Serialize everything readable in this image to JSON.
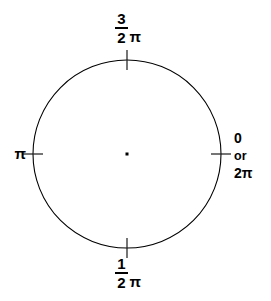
{
  "figure": {
    "type": "unit-circle-radian-diagram",
    "title": "",
    "canvas": {
      "width": 271,
      "height": 301
    },
    "background_color": "#ffffff",
    "stroke_color": "#000000"
  },
  "circle": {
    "center_x": 127,
    "center_y": 154,
    "radius": 94,
    "stroke_width": 1.1
  },
  "center_point": {
    "label": "center-dot",
    "size": 3
  },
  "ticks": [
    {
      "name": "tick-right-0",
      "angle_deg": 0,
      "orientation": "horizontal",
      "length": 20
    },
    {
      "name": "tick-top-3pi2",
      "angle_deg": 90,
      "orientation": "vertical",
      "length": 20
    },
    {
      "name": "tick-left-pi",
      "angle_deg": 180,
      "orientation": "horizontal",
      "length": 20
    },
    {
      "name": "tick-bottom-pi2",
      "angle_deg": 270,
      "orientation": "vertical",
      "length": 20
    }
  ],
  "labels": {
    "top": {
      "name": "label-three-halves-pi",
      "numerator": "3",
      "denominator": "2",
      "pi": "π"
    },
    "bottom": {
      "name": "label-one-half-pi",
      "numerator": "1",
      "denominator": "2",
      "pi": "π"
    },
    "left": {
      "name": "label-pi",
      "text": "π"
    },
    "right": {
      "name": "label-zero-or-two-pi",
      "line1": "0",
      "line2": "or",
      "line3": "2π"
    }
  },
  "chart_data": {
    "type": "scatter",
    "xlabel": "",
    "ylabel": "",
    "grid": false,
    "legend": null,
    "xlim": [
      -1,
      1
    ],
    "ylim": [
      -1,
      1
    ],
    "categories": [
      "0 or 2π",
      "3/2 π",
      "π",
      "1/2 π"
    ],
    "values": [
      0,
      1.5,
      1,
      0.5
    ],
    "annotations": [
      {
        "label": "0 or 2π",
        "radians": 0,
        "screen_angle_deg": 0,
        "position": "right"
      },
      {
        "label": "3/2 π",
        "radians": 4.712389,
        "screen_angle_deg": 90,
        "position": "top"
      },
      {
        "label": "π",
        "radians": 3.141593,
        "screen_angle_deg": 180,
        "position": "left"
      },
      {
        "label": "1/2 π",
        "radians": 1.570796,
        "screen_angle_deg": 270,
        "position": "bottom"
      }
    ]
  }
}
